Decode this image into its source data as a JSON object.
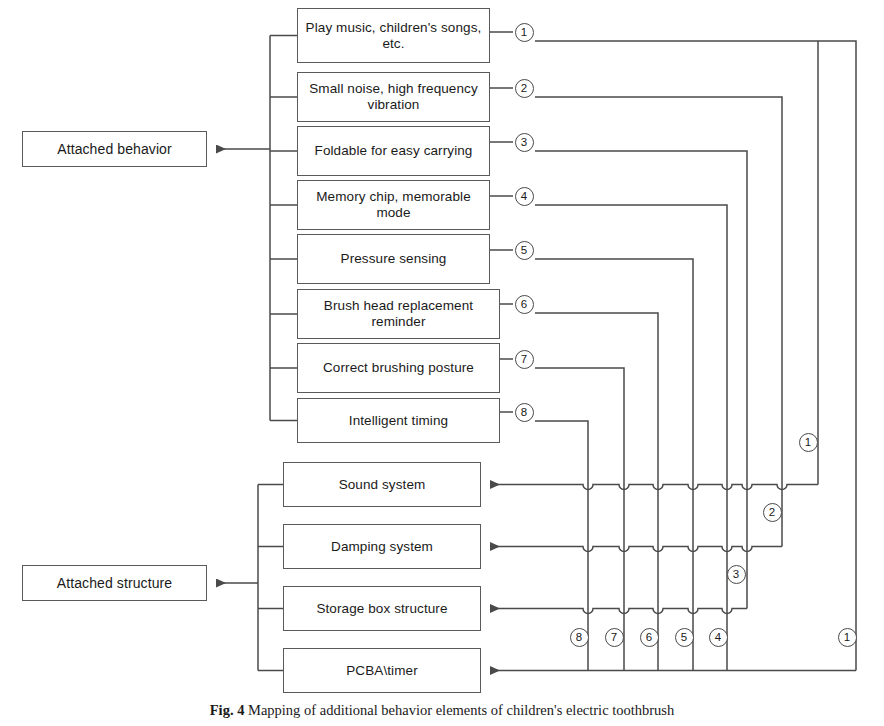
{
  "figure": {
    "caption_label": "Fig. 4",
    "caption_text": "Mapping of additional behavior elements of children's electric toothbrush"
  },
  "roots": [
    {
      "id": "attached-behavior",
      "label": "Attached behavior",
      "x": 22,
      "y": 131,
      "w": 185,
      "h": 36
    },
    {
      "id": "attached-structure",
      "label": "Attached structure",
      "x": 22,
      "y": 565,
      "w": 185,
      "h": 36
    }
  ],
  "behavior_boxes": [
    {
      "n": "1",
      "label": "Play music, children's songs, etc.",
      "x": 297,
      "y": 8,
      "w": 193,
      "h": 55
    },
    {
      "n": "2",
      "label": "Small noise, high frequency vibration",
      "x": 297,
      "y": 72,
      "w": 193,
      "h": 50
    },
    {
      "n": "3",
      "label": "Foldable for easy carrying",
      "x": 297,
      "y": 126,
      "w": 193,
      "h": 50
    },
    {
      "n": "4",
      "label": "Memory chip, memorable mode",
      "x": 297,
      "y": 180,
      "w": 193,
      "h": 50
    },
    {
      "n": "5",
      "label": "Pressure sensing",
      "x": 297,
      "y": 234,
      "w": 193,
      "h": 50
    },
    {
      "n": "6",
      "label": "Brush head replacement reminder",
      "x": 297,
      "y": 289,
      "w": 203,
      "h": 50
    },
    {
      "n": "7",
      "label": "Correct brushing posture",
      "x": 297,
      "y": 343,
      "w": 203,
      "h": 50
    },
    {
      "n": "8",
      "label": "Intelligent timing",
      "x": 297,
      "y": 398,
      "w": 203,
      "h": 45
    }
  ],
  "structure_boxes": [
    {
      "id": "sound-system",
      "label": "Sound system",
      "x": 283,
      "y": 462,
      "w": 198,
      "h": 45
    },
    {
      "id": "damping-system",
      "label": "Damping system",
      "x": 283,
      "y": 524,
      "w": 198,
      "h": 45
    },
    {
      "id": "storage-box",
      "label": "Storage box structure",
      "x": 283,
      "y": 586,
      "w": 198,
      "h": 45
    },
    {
      "id": "pcba-timer",
      "label": "PCBA\\timer",
      "x": 283,
      "y": 648,
      "w": 198,
      "h": 45
    }
  ],
  "source_numbers": [
    {
      "n": "1",
      "x": 524,
      "y": 32
    },
    {
      "n": "2",
      "x": 524,
      "y": 88
    },
    {
      "n": "3",
      "x": 524,
      "y": 142
    },
    {
      "n": "4",
      "x": 524,
      "y": 196
    },
    {
      "n": "5",
      "x": 524,
      "y": 250
    },
    {
      "n": "6",
      "x": 524,
      "y": 304
    },
    {
      "n": "7",
      "x": 524,
      "y": 359
    },
    {
      "n": "8",
      "x": 524,
      "y": 412
    }
  ],
  "target_numbers": [
    {
      "n": "1",
      "x": 808,
      "y": 442
    },
    {
      "n": "2",
      "x": 772,
      "y": 512
    },
    {
      "n": "3",
      "x": 736,
      "y": 574
    },
    {
      "n": "8",
      "x": 579,
      "y": 637
    },
    {
      "n": "7",
      "x": 614,
      "y": 637
    },
    {
      "n": "6",
      "x": 649,
      "y": 637
    },
    {
      "n": "5",
      "x": 684,
      "y": 637
    },
    {
      "n": "4",
      "x": 718,
      "y": 637
    },
    {
      "n": "1",
      "x": 847,
      "y": 637
    }
  ],
  "routing": {
    "note": "Each numbered behavior output routes right, turns down a dedicated vertical, then enters a structure row from the right.",
    "connections": [
      {
        "n": "1",
        "from_row_y": 41,
        "vertical_x": 856,
        "to_row_y": 671,
        "target": "pcba-timer"
      },
      {
        "n": "1b",
        "from_row_y": 41,
        "vertical_x": 818,
        "to_row_y": 485,
        "target": "sound-system"
      },
      {
        "n": "2",
        "from_row_y": 97,
        "vertical_x": 782,
        "to_row_y": 547,
        "target": "damping-system"
      },
      {
        "n": "3",
        "from_row_y": 151,
        "vertical_x": 747,
        "to_row_y": 609,
        "target": "storage-box"
      },
      {
        "n": "4",
        "from_row_y": 205,
        "vertical_x": 727,
        "to_row_y": 671,
        "target": "pcba-timer"
      },
      {
        "n": "5",
        "from_row_y": 259,
        "vertical_x": 693,
        "to_row_y": 671,
        "target": "pcba-timer"
      },
      {
        "n": "6",
        "from_row_y": 313,
        "vertical_x": 658,
        "to_row_y": 671,
        "target": "pcba-timer"
      },
      {
        "n": "7",
        "from_row_y": 368,
        "vertical_x": 624,
        "to_row_y": 671,
        "target": "pcba-timer"
      },
      {
        "n": "8",
        "from_row_y": 421,
        "vertical_x": 588,
        "to_row_y": 671,
        "target": "pcba-timer"
      }
    ]
  },
  "colors": {
    "line": "#4a4a4a",
    "box_border": "#5a5a5a",
    "text": "#1a1a1a",
    "background": "#ffffff"
  }
}
